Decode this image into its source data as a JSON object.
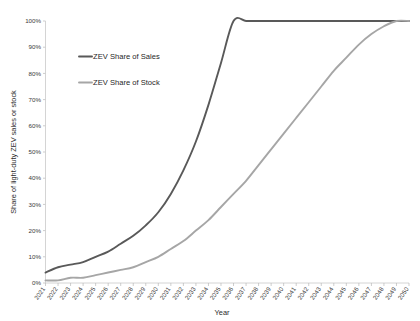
{
  "chart_data": {
    "type": "line",
    "title": "",
    "xlabel": "Year",
    "ylabel": "Share of light-duty ZEV sales or stock",
    "xlim": [
      2021,
      2050
    ],
    "ylim": [
      0,
      100
    ],
    "grid": false,
    "legend_position": "upper-left-inside",
    "x": [
      2021,
      2022,
      2023,
      2024,
      2025,
      2026,
      2027,
      2028,
      2029,
      2030,
      2031,
      2032,
      2033,
      2034,
      2035,
      2036,
      2037,
      2038,
      2039,
      2040,
      2041,
      2042,
      2043,
      2044,
      2045,
      2046,
      2047,
      2048,
      2049,
      2050
    ],
    "xticklabels": [
      "2021",
      "2022",
      "2023",
      "2024",
      "2025",
      "2026",
      "2027",
      "2028",
      "2029",
      "2030",
      "2031",
      "2032",
      "2033",
      "2034",
      "2035",
      "2036",
      "2037",
      "2038",
      "2039",
      "2040",
      "2041",
      "2042",
      "2043",
      "2044",
      "2045",
      "2046",
      "2047",
      "2048",
      "2049",
      "2050"
    ],
    "yticklabels": [
      "0%",
      "10%",
      "20%",
      "30%",
      "40%",
      "50%",
      "60%",
      "70%",
      "80%",
      "90%",
      "100%"
    ],
    "ytickvalues": [
      0,
      10,
      20,
      30,
      40,
      50,
      60,
      70,
      80,
      90,
      100
    ],
    "series": [
      {
        "name": "ZEV Share of Sales",
        "color": "#595959",
        "values": [
          4,
          6,
          7,
          8,
          10,
          12,
          15,
          18,
          22,
          27,
          34,
          43,
          54,
          68,
          84,
          100,
          100,
          100,
          100,
          100,
          100,
          100,
          100,
          100,
          100,
          100,
          100,
          100,
          100,
          100
        ]
      },
      {
        "name": "ZEV Share of Stock",
        "color": "#a6a6a6",
        "values": [
          1,
          1,
          2,
          2,
          3,
          4,
          5,
          6,
          8,
          10,
          13,
          16,
          20,
          24,
          29,
          34,
          39,
          45,
          51,
          57,
          63,
          69,
          75,
          81,
          86,
          91,
          95,
          98,
          100,
          100
        ]
      }
    ]
  },
  "legend": {
    "items": [
      {
        "label": "ZEV Share of Sales",
        "color": "#595959"
      },
      {
        "label": "ZEV Share of Stock",
        "color": "#a6a6a6"
      }
    ]
  }
}
